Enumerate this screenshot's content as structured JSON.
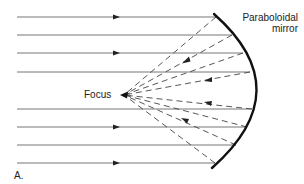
{
  "diagram": {
    "labels": {
      "mirror_line1": "Paraboloidal",
      "mirror_line2": "mirror",
      "focus": "Focus",
      "panel": "A."
    },
    "focus_point": {
      "x": 122,
      "y": 95
    },
    "incoming_rays": [
      {
        "y": 17,
        "end_x": 216,
        "arrow": true
      },
      {
        "y": 35,
        "end_x": 232,
        "arrow": false
      },
      {
        "y": 53,
        "end_x": 243,
        "arrow": true
      },
      {
        "y": 72,
        "end_x": 250,
        "arrow": false
      },
      {
        "y": 109,
        "end_x": 252,
        "arrow": false
      },
      {
        "y": 127,
        "end_x": 247,
        "arrow": true
      },
      {
        "y": 145,
        "end_x": 236,
        "arrow": false
      },
      {
        "y": 163,
        "end_x": 215,
        "arrow": true
      }
    ],
    "reflected_arrows": [
      {
        "x": 185,
        "y": 61
      },
      {
        "x": 210,
        "y": 80
      },
      {
        "x": 210,
        "y": 104
      },
      {
        "x": 185,
        "y": 121
      }
    ],
    "colors": {
      "ray": "#777777",
      "mirror": "#111111",
      "dashed": "#444444",
      "text": "#222222"
    }
  }
}
